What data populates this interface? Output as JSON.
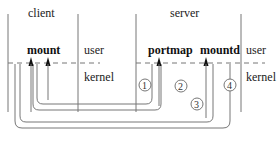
{
  "diagram": {
    "sections": {
      "client_label": "client",
      "server_label": "server"
    },
    "client": {
      "process": "mount",
      "user_label": "user",
      "kernel_label": "kernel"
    },
    "server": {
      "processes": [
        "portmap",
        "mountd"
      ],
      "user_label": "user",
      "kernel_label": "kernel"
    },
    "steps": [
      {
        "label": "1",
        "description": "mount to portmap request"
      },
      {
        "label": "2",
        "description": "portmap reply to mount"
      },
      {
        "label": "3",
        "description": "mount to mountd request"
      },
      {
        "label": "4",
        "description": "mountd reply to mount"
      }
    ],
    "colors": {
      "line": "#666666",
      "text": "#222222",
      "background": "#ffffff"
    }
  }
}
